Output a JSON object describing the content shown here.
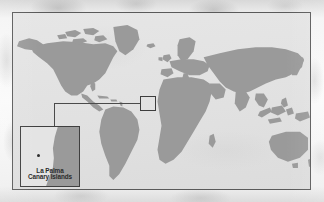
{
  "figure": {
    "kind": "locator-map",
    "frame_name": "world-map-plate",
    "projection_note": "world map, grey landmasses on light grey ocean"
  },
  "inset": {
    "title_line_1": "La Palma",
    "title_line_2": "Canary Islands",
    "marker_name": "la-palma-island-dot",
    "marker_label": "La Palma"
  },
  "highlight": {
    "region_label": "Canary Islands / NW Africa",
    "box_name": "detail-region-box"
  },
  "colors": {
    "land": "#9a9a9a",
    "ocean": "#e3e3e3",
    "frame": "#5a5a5a",
    "inset_border": "#3f3f3f",
    "leader_line": "#4a4a4a",
    "label_text": "#2a2a2a",
    "page_margin": "#f4f4f4"
  },
  "geography": {
    "landmasses": [
      "North America",
      "Greenland",
      "Canadian Arctic Archipelago",
      "South America",
      "Europe",
      "Scandinavia",
      "Africa",
      "Asia",
      "Japan",
      "Indonesia",
      "Australia",
      "New Zealand",
      "Madagascar",
      "British Isles",
      "Iceland"
    ]
  }
}
